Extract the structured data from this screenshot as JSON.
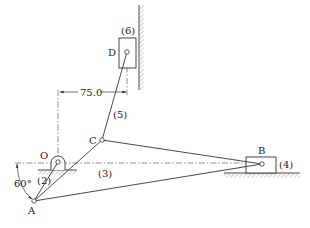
{
  "figure": {
    "type": "linkage-mechanism",
    "points": {
      "O": {
        "label": "O",
        "x": 58,
        "y": 162
      },
      "A": {
        "label": "A",
        "x": 34,
        "y": 201
      },
      "B": {
        "label": "B",
        "x": 262,
        "y": 164
      },
      "C": {
        "label": "C",
        "x": 102,
        "y": 140
      },
      "D": {
        "label": "D",
        "x": 127,
        "y": 52
      }
    },
    "links": [
      {
        "id": "2",
        "label": "(2)",
        "from": "O",
        "to": "A"
      },
      {
        "id": "3",
        "label": "(3)",
        "from": "A",
        "to": "B",
        "via": "C"
      },
      {
        "id": "4",
        "label": "(4)",
        "element": "slider-B"
      },
      {
        "id": "5",
        "label": "(5)",
        "from": "C",
        "to": "D"
      },
      {
        "id": "6",
        "label": "(6)",
        "element": "slider-D"
      }
    ],
    "dimensions": {
      "horizontal_offset": {
        "label": "75.0",
        "from": "O",
        "to": "D"
      },
      "crank_angle": {
        "label": "60°"
      }
    },
    "colors": {
      "line": "#333333",
      "background": "#ffffff"
    }
  }
}
